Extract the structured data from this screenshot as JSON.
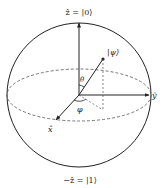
{
  "diagram": {
    "type": "bloch-sphere",
    "labels": {
      "z_top": "ẑ = |0⟩",
      "z_bottom": "−ẑ = |1⟩",
      "psi": "|ψ⟩",
      "theta": "θ",
      "phi": "φ",
      "x_axis": "x̂",
      "y_axis": "ŷ"
    },
    "colors": {
      "stroke": "#222222",
      "dashed": "#555555",
      "background": "#ffffff"
    }
  }
}
